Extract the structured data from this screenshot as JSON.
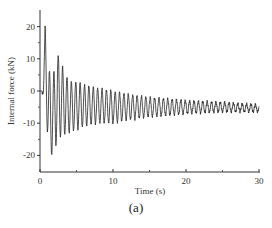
{
  "chart_data": {
    "type": "line",
    "title": "",
    "caption": "(a)",
    "xlabel": "Time (s)",
    "ylabel": "Internal force (kN)",
    "xlim": [
      0,
      30
    ],
    "ylim": [
      -25,
      25
    ],
    "xticks": [
      0,
      10,
      20,
      30
    ],
    "yticks": [
      20,
      10,
      0,
      -10,
      -20
    ],
    "grid": false,
    "legend": "none",
    "series": [
      {
        "name": "Internal force",
        "color": "#222222",
        "description": "Damped oscillation: initial peak ~20 kN near t≈0.7s, minimum ~-20 kN near t≈1.2-1.8s, decaying toward ~-5 kN mean with ~±1 kN oscillation by t=30s",
        "envelope": {
          "t": [
            0,
            0.3,
            0.7,
            1.2,
            1.8,
            2.4,
            3,
            4,
            5,
            6,
            8,
            10,
            12,
            15,
            18,
            20,
            22,
            25,
            28,
            30
          ],
          "upper": [
            0,
            0,
            20,
            7,
            5,
            12,
            8,
            3,
            3,
            2,
            1,
            0,
            -1,
            -2,
            -2.5,
            -3,
            -3.2,
            -3.5,
            -4,
            -4.2
          ],
          "lower": [
            -1,
            -1,
            -1,
            -20,
            -20,
            -15,
            -14,
            -13,
            -12,
            -11,
            -10,
            -10,
            -9,
            -8,
            -7.5,
            -7,
            -6.8,
            -6.5,
            -6.5,
            -6.5
          ]
        },
        "period_s": 0.6
      }
    ]
  }
}
